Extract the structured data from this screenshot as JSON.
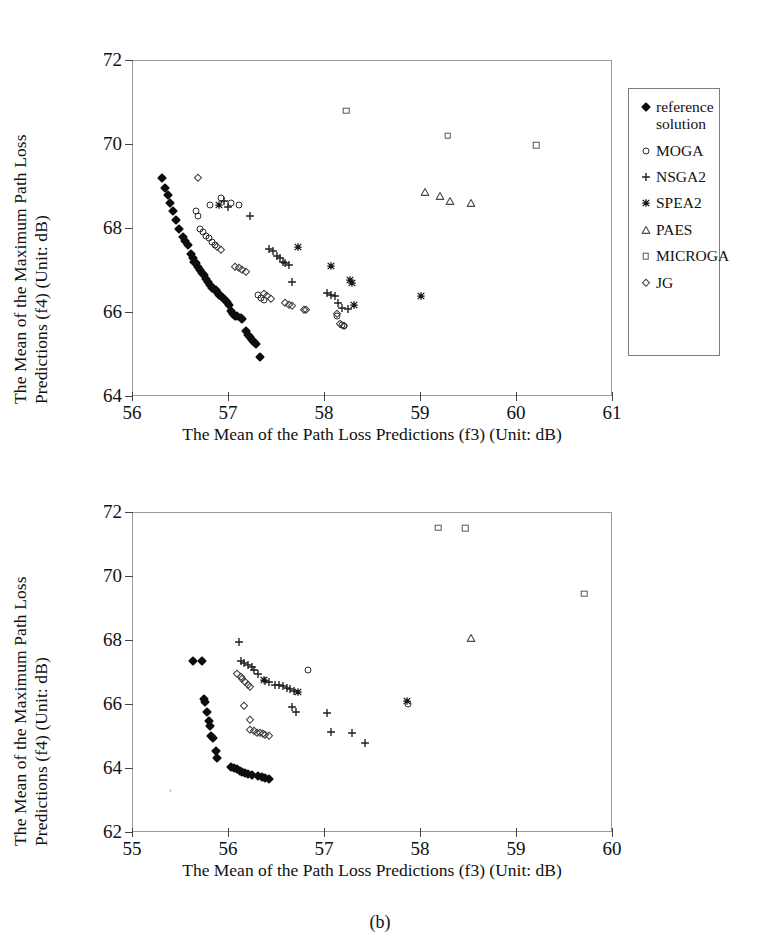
{
  "figure": {
    "caption": "(b)",
    "legend_entries": [
      {
        "label": "reference\nsolution",
        "marker": "filled-diamond",
        "key": "refsol"
      },
      {
        "label": "MOGA",
        "marker": "open-circle",
        "key": "moga"
      },
      {
        "label": "NSGA2",
        "marker": "plus",
        "key": "nsga2"
      },
      {
        "label": "SPEA2",
        "marker": "asterisk",
        "key": "spea2"
      },
      {
        "label": "PAES",
        "marker": "open-triangle",
        "key": "paes"
      },
      {
        "label": "MICROGA",
        "marker": "open-square",
        "key": "microga"
      },
      {
        "label": "JG",
        "marker": "open-diamond",
        "key": "jg"
      }
    ]
  },
  "chart_data": [
    {
      "id": "panel-a",
      "type": "scatter",
      "title": "",
      "xlabel": "The Mean of the Path Loss Predictions (f3) (Unit: dB)",
      "ylabel_line1": "The Mean of the Maximum Path Loss",
      "ylabel_line2": "Predictions (f4) (Unit: dB)",
      "xlim": [
        56,
        61
      ],
      "ylim": [
        64,
        72
      ],
      "xticks": [
        56,
        57,
        58,
        59,
        60,
        61
      ],
      "yticks": [
        64,
        66,
        68,
        70,
        72
      ],
      "grid": false,
      "legend_position": "right-outside",
      "series": [
        {
          "name": "reference solution",
          "marker": "filled-diamond",
          "key": "refsol",
          "points": [
            [
              56.3,
              69.22
            ],
            [
              56.33,
              68.98
            ],
            [
              56.36,
              68.82
            ],
            [
              56.39,
              68.62
            ],
            [
              56.42,
              68.44
            ],
            [
              56.45,
              68.22
            ],
            [
              56.48,
              68.0
            ],
            [
              56.52,
              67.8
            ],
            [
              56.54,
              67.72
            ],
            [
              56.57,
              67.62
            ],
            [
              56.6,
              67.4
            ],
            [
              56.62,
              67.3
            ],
            [
              56.64,
              67.22
            ],
            [
              56.66,
              67.2
            ],
            [
              56.68,
              67.1
            ],
            [
              56.7,
              67.02
            ],
            [
              56.72,
              66.96
            ],
            [
              56.74,
              66.9
            ],
            [
              56.76,
              66.8
            ],
            [
              56.78,
              66.74
            ],
            [
              56.8,
              66.66
            ],
            [
              56.82,
              66.6
            ],
            [
              56.84,
              66.58
            ],
            [
              56.86,
              66.54
            ],
            [
              56.88,
              66.5
            ],
            [
              56.9,
              66.44
            ],
            [
              56.92,
              66.4
            ],
            [
              56.94,
              66.36
            ],
            [
              56.96,
              66.32
            ],
            [
              56.98,
              66.26
            ],
            [
              57.0,
              66.18
            ],
            [
              57.02,
              66.04
            ],
            [
              57.04,
              65.98
            ],
            [
              57.06,
              65.94
            ],
            [
              57.08,
              65.92
            ],
            [
              57.12,
              65.88
            ],
            [
              57.14,
              65.86
            ],
            [
              57.18,
              65.56
            ],
            [
              57.2,
              65.48
            ],
            [
              57.22,
              65.42
            ],
            [
              57.24,
              65.36
            ],
            [
              57.26,
              65.3
            ],
            [
              57.28,
              65.26
            ],
            [
              57.32,
              64.96
            ]
          ]
        },
        {
          "name": "MOGA",
          "marker": "open-circle",
          "key": "moga",
          "points": [
            [
              56.8,
              68.58
            ],
            [
              56.92,
              68.74
            ],
            [
              57.02,
              68.62
            ],
            [
              57.1,
              68.58
            ],
            [
              56.66,
              68.42
            ],
            [
              56.68,
              68.3
            ],
            [
              56.7,
              68.0
            ],
            [
              56.73,
              67.92
            ],
            [
              56.76,
              67.84
            ],
            [
              56.79,
              67.78
            ],
            [
              56.82,
              67.7
            ],
            [
              56.85,
              67.62
            ],
            [
              57.3,
              66.42
            ],
            [
              57.33,
              66.36
            ],
            [
              57.36,
              66.3
            ],
            [
              58.12,
              65.92
            ],
            [
              58.18,
              65.72
            ],
            [
              58.2,
              65.68
            ]
          ]
        },
        {
          "name": "NSGA2",
          "marker": "plus",
          "key": "nsga2",
          "points": [
            [
              56.95,
              68.66
            ],
            [
              56.99,
              68.52
            ],
            [
              57.22,
              68.3
            ],
            [
              57.42,
              67.52
            ],
            [
              57.46,
              67.48
            ],
            [
              57.5,
              67.36
            ],
            [
              57.53,
              67.3
            ],
            [
              57.56,
              67.22
            ],
            [
              57.58,
              67.18
            ],
            [
              57.62,
              67.14
            ],
            [
              57.66,
              66.74
            ],
            [
              58.02,
              66.48
            ],
            [
              58.06,
              66.44
            ],
            [
              58.1,
              66.4
            ],
            [
              58.14,
              66.24
            ],
            [
              58.18,
              66.12
            ],
            [
              58.24,
              66.1
            ]
          ]
        },
        {
          "name": "SPEA2",
          "marker": "asterisk",
          "key": "spea2",
          "points": [
            [
              56.9,
              68.56
            ],
            [
              57.72,
              67.58
            ],
            [
              58.06,
              67.12
            ],
            [
              58.26,
              66.78
            ],
            [
              58.28,
              66.72
            ],
            [
              58.3,
              66.18
            ],
            [
              59.0,
              66.4
            ]
          ]
        },
        {
          "name": "PAES",
          "marker": "open-triangle",
          "key": "paes",
          "points": [
            [
              59.04,
              68.88
            ],
            [
              59.2,
              68.78
            ],
            [
              59.3,
              68.66
            ],
            [
              59.52,
              68.62
            ]
          ]
        },
        {
          "name": "MICROGA",
          "marker": "open-square",
          "key": "microga",
          "points": [
            [
              58.22,
              70.82
            ],
            [
              59.28,
              70.22
            ],
            [
              60.2,
              70.0
            ]
          ]
        },
        {
          "name": "JG",
          "marker": "open-diamond",
          "key": "jg",
          "points": [
            [
              56.68,
              69.22
            ],
            [
              56.88,
              67.56
            ],
            [
              56.92,
              67.5
            ],
            [
              57.06,
              67.1
            ],
            [
              57.1,
              67.08
            ],
            [
              57.14,
              67.02
            ],
            [
              57.18,
              66.98
            ],
            [
              57.36,
              66.46
            ],
            [
              57.4,
              66.4
            ],
            [
              57.44,
              66.34
            ],
            [
              57.58,
              66.24
            ],
            [
              57.62,
              66.2
            ],
            [
              57.66,
              66.16
            ],
            [
              57.78,
              66.08
            ],
            [
              57.8,
              66.06
            ],
            [
              58.12,
              65.98
            ],
            [
              58.16,
              65.74
            ],
            [
              58.2,
              65.7
            ]
          ]
        }
      ]
    },
    {
      "id": "panel-b",
      "type": "scatter",
      "title": "",
      "xlabel": "The Mean of the Path Loss Predictions (f3) (Unit: dB)",
      "ylabel_line1": "The Mean of the Maximum Path Loss",
      "ylabel_line2": "Predictions (f4) (Unit: dB)",
      "xlim": [
        55,
        60
      ],
      "ylim": [
        62,
        72
      ],
      "xticks": [
        55,
        56,
        57,
        58,
        59,
        60
      ],
      "yticks": [
        62,
        64,
        66,
        68,
        70,
        72
      ],
      "grid": false,
      "legend_position": "right-outside",
      "series": [
        {
          "name": "reference solution",
          "marker": "filled-diamond",
          "key": "refsol",
          "points": [
            [
              55.62,
              67.38
            ],
            [
              55.72,
              67.36
            ],
            [
              55.74,
              66.18
            ],
            [
              55.75,
              66.1
            ],
            [
              55.77,
              65.78
            ],
            [
              55.79,
              65.5
            ],
            [
              55.8,
              65.34
            ],
            [
              55.81,
              65.02
            ],
            [
              55.83,
              64.96
            ],
            [
              55.86,
              64.56
            ],
            [
              55.88,
              64.34
            ],
            [
              56.02,
              64.06
            ],
            [
              56.05,
              64.04
            ],
            [
              56.08,
              64.0
            ],
            [
              56.11,
              63.94
            ],
            [
              56.14,
              63.9
            ],
            [
              56.17,
              63.88
            ],
            [
              56.2,
              63.84
            ],
            [
              56.24,
              63.82
            ],
            [
              56.3,
              63.78
            ],
            [
              56.34,
              63.76
            ],
            [
              56.38,
              63.72
            ],
            [
              56.42,
              63.7
            ]
          ]
        },
        {
          "name": "MOGA",
          "marker": "open-circle",
          "key": "moga",
          "points": [
            [
              56.82,
              67.08
            ],
            [
              57.86,
              66.02
            ]
          ]
        },
        {
          "name": "NSGA2",
          "marker": "plus",
          "key": "nsga2",
          "points": [
            [
              56.1,
              67.96
            ],
            [
              56.12,
              67.38
            ],
            [
              56.16,
              67.3
            ],
            [
              56.2,
              67.24
            ],
            [
              56.24,
              67.18
            ],
            [
              56.26,
              67.1
            ],
            [
              56.3,
              66.98
            ],
            [
              56.38,
              66.74
            ],
            [
              56.42,
              66.72
            ],
            [
              56.48,
              66.64
            ],
            [
              56.52,
              66.62
            ],
            [
              56.56,
              66.58
            ],
            [
              56.6,
              66.54
            ],
            [
              56.64,
              66.5
            ],
            [
              56.68,
              66.44
            ],
            [
              56.66,
              65.94
            ],
            [
              56.7,
              65.78
            ],
            [
              57.02,
              65.74
            ],
            [
              57.06,
              65.16
            ],
            [
              57.28,
              65.14
            ],
            [
              57.42,
              64.82
            ]
          ]
        },
        {
          "name": "SPEA2",
          "marker": "asterisk",
          "key": "spea2",
          "points": [
            [
              56.36,
              66.78
            ],
            [
              56.72,
              66.42
            ],
            [
              57.85,
              66.14
            ]
          ]
        },
        {
          "name": "PAES",
          "marker": "open-triangle",
          "key": "paes",
          "points": [
            [
              58.52,
              68.08
            ]
          ]
        },
        {
          "name": "MICROGA",
          "marker": "open-square",
          "key": "microga",
          "points": [
            [
              58.18,
              71.54
            ],
            [
              58.46,
              71.52
            ],
            [
              59.7,
              69.48
            ]
          ]
        },
        {
          "name": "JG",
          "marker": "open-diamond",
          "key": "jg",
          "points": [
            [
              56.08,
              66.96
            ],
            [
              56.12,
              66.88
            ],
            [
              56.14,
              66.82
            ],
            [
              56.17,
              66.72
            ],
            [
              56.2,
              66.62
            ],
            [
              56.22,
              66.56
            ],
            [
              56.16,
              65.98
            ],
            [
              56.22,
              65.52
            ],
            [
              56.22,
              65.22
            ],
            [
              56.26,
              65.2
            ],
            [
              56.29,
              65.14
            ],
            [
              56.32,
              65.12
            ],
            [
              56.35,
              65.08
            ],
            [
              56.38,
              65.06
            ],
            [
              56.42,
              65.02
            ]
          ]
        }
      ]
    }
  ]
}
